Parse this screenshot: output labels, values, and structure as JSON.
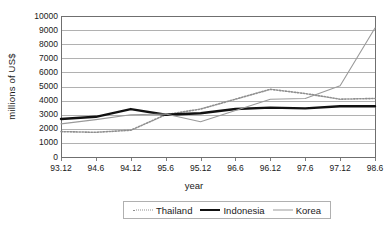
{
  "chart_data": {
    "type": "line",
    "title": "",
    "xlabel": "year",
    "ylabel": "millions of US$",
    "categories": [
      "93.12",
      "94.6",
      "94.12",
      "95.6",
      "95.12",
      "96.6",
      "96.12",
      "97.6",
      "97.12",
      "98.6"
    ],
    "ylim": [
      0,
      10000
    ],
    "ytick_labels": [
      "10000",
      "9000",
      "8000",
      "7000",
      "6000",
      "5000",
      "4000",
      "3000",
      "2000",
      "1000",
      "0"
    ],
    "ytick_values": [
      10000,
      9000,
      8000,
      7000,
      6000,
      5000,
      4000,
      3000,
      2000,
      1000,
      0
    ],
    "grid": true,
    "legend_position": "bottom",
    "series": [
      {
        "name": "Thailand",
        "style": "dotted",
        "color": "#8f8f8f",
        "width": 1.6,
        "values": [
          1800,
          1750,
          1900,
          3000,
          3400,
          4100,
          4800,
          4500,
          4100,
          4150
        ]
      },
      {
        "name": "Indonesia",
        "style": "solid",
        "color": "#111111",
        "width": 2.4,
        "values": [
          2700,
          2850,
          3400,
          3000,
          3100,
          3400,
          3500,
          3450,
          3600,
          3600
        ]
      },
      {
        "name": "Korea",
        "style": "solid",
        "color": "#9a9a9a",
        "width": 1.1,
        "values": [
          2350,
          2650,
          3000,
          3050,
          2500,
          3300,
          4100,
          4150,
          5050,
          9150
        ]
      }
    ]
  },
  "plot": {
    "left": 61,
    "right": 375,
    "top": 16,
    "bottom": 157,
    "frame_color": "#6f6f6f",
    "grid_color": "#a8a8a8",
    "background": "#ffffff"
  },
  "legend": {
    "items": [
      {
        "label": "Thailand",
        "swatch": "dotted-line-swatch"
      },
      {
        "label": "Indonesia",
        "swatch": "thick-solid-line-swatch"
      },
      {
        "label": "Korea",
        "swatch": "thin-solid-line-swatch"
      }
    ]
  }
}
